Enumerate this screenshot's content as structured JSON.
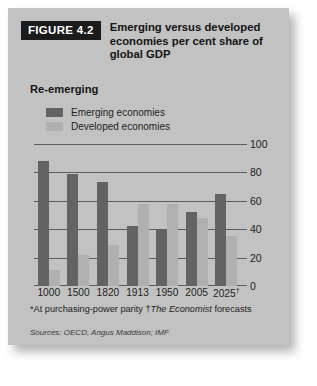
{
  "figure": {
    "tag": "FIGURE 4.2",
    "title": "Emerging versus developed economies per cent share of global GDP",
    "subtitle": "Re-emerging"
  },
  "legend": {
    "items": [
      {
        "label": "Emerging economies",
        "color": "#636363",
        "swatch_name": "legend-swatch-emerging"
      },
      {
        "label": "Developed economies",
        "color": "#b0b0b0",
        "swatch_name": "legend-swatch-developed"
      }
    ]
  },
  "footnotes": {
    "ppp": "*At purchasing-power parity",
    "forecast_marker": "†",
    "forecast_source": "The Economist",
    "forecast_text": " forecasts",
    "sources": "Sources: OECD, Angus Maddison; IMF"
  },
  "chart_data": {
    "type": "bar",
    "title": "Emerging versus developed economies per cent share of global GDP",
    "subtitle": "Re-emerging",
    "categories": [
      "1000",
      "1500",
      "1820",
      "1913",
      "1950",
      "2005",
      "2025†"
    ],
    "series": [
      {
        "name": "Emerging economies",
        "color": "#636363",
        "values": [
          88,
          79,
          73,
          42,
          40,
          52,
          65
        ]
      },
      {
        "name": "Developed economies",
        "color": "#b0b0b0",
        "values": [
          11,
          22,
          29,
          58,
          58,
          48,
          35
        ]
      }
    ],
    "xlabel": "",
    "ylabel": "",
    "ylim": [
      0,
      100
    ],
    "yticks": [
      0,
      20,
      40,
      60,
      80,
      100
    ],
    "ytick_labels": [
      "0",
      "20",
      "40",
      "60",
      "80",
      "100"
    ],
    "grid": true,
    "legend_position": "top-left"
  }
}
